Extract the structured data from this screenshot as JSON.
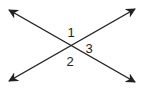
{
  "diagram": {
    "line_color": "#222222",
    "lines": [
      {
        "name": "line-descending",
        "x1": 9,
        "y1": 10,
        "x2": 135,
        "y2": 82
      },
      {
        "name": "line-ascending",
        "x1": 9,
        "y1": 81,
        "x2": 135,
        "y2": 9
      }
    ],
    "angle_labels": [
      {
        "text": "1",
        "x": 71,
        "y": 37
      },
      {
        "text": "3",
        "x": 89,
        "y": 53
      },
      {
        "text": "2",
        "x": 70,
        "y": 66
      }
    ]
  }
}
